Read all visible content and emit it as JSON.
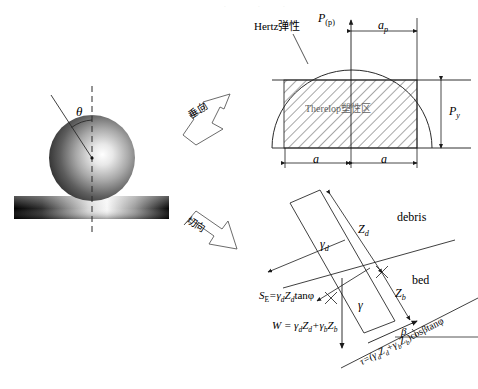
{
  "figure": {
    "type": "schematic-diagram",
    "ink_color": "#1a1a1a",
    "hatch_color": "#3a3a3a"
  },
  "left_panel": {
    "name": "sphere-on-surface",
    "angle_label": "θ",
    "sphere_gradient": {
      "highlight": "#f2f2f2",
      "shadow": "#2b2b2b"
    },
    "bar_gradient": {
      "dark": "#000000",
      "light": "#f5f5f5"
    }
  },
  "arrows": {
    "normal": {
      "label": "垂向",
      "direction": "up-right"
    },
    "tangential": {
      "label": "切向",
      "direction": "down-right"
    }
  },
  "top_right_panel": {
    "name": "hertz-pressure-distribution",
    "curve_label": "Hertz弹性",
    "axis_label": "P",
    "axis_label_sub": "(p)",
    "ap_label": "a",
    "ap_sub": "p",
    "py_label": "P",
    "py_sub": "y",
    "a_left_label": "a",
    "a_right_label": "a",
    "zone_label": "Therelop塑性区"
  },
  "bottom_right_panel": {
    "name": "debris-bed-shear",
    "region_debris": "debris",
    "region_bed": "bed",
    "zd_label": "Z",
    "zd_sub": "d",
    "zb_label": "Z",
    "zb_sub": "b",
    "gamma_d_label": "γ",
    "gamma_d_sub": "d",
    "gamma_label": "γ",
    "beta_label": "β",
    "eq_se": "S",
    "eq_se_sub": "E",
    "eq_se_rest": "=γ",
    "eq_se_rest2": "Z",
    "eq_se_rest3": "tanφ",
    "eq_w_lead": "W = γ",
    "eq_w_z": "Z",
    "eq_w_plus": "+γ",
    "eq_w_z2": "Z",
    "eq_tau": "τ=(γ",
    "eq_tau_z": "Z",
    "eq_tau_plus": "+γ",
    "eq_tau_z2": "Z",
    "eq_tau_end": ")cosβtanφ"
  }
}
